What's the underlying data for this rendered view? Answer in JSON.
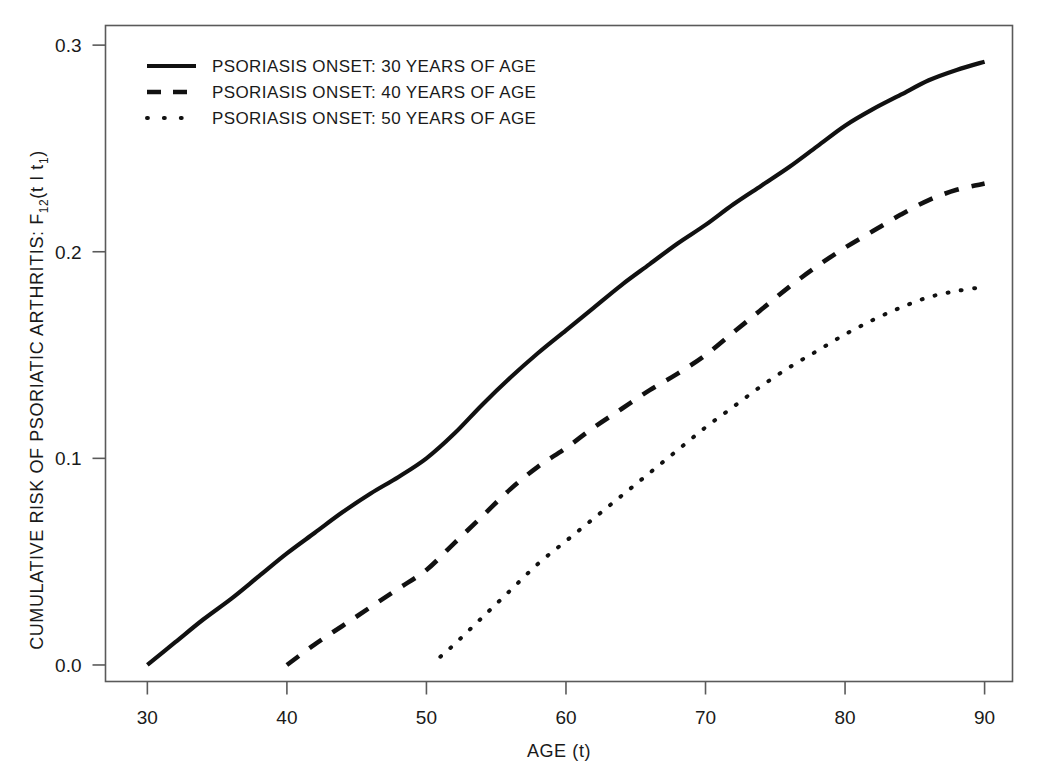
{
  "chart_data": {
    "type": "line",
    "title": "",
    "xlabel": "AGE (t)",
    "ylabel": "CUMULATIVE RISK OF PSORIATIC ARTHRITIS: F12(t | t1)",
    "ylabel_parts": {
      "prefix": "CUMULATIVE RISK OF PSORIATIC ARTHRITIS: F",
      "subscript": "12",
      "suffix": "(t I t",
      "suffix_subscript": "1",
      "tail": ")"
    },
    "xlim": [
      27,
      92
    ],
    "ylim": [
      -0.008,
      0.3095
    ],
    "xticks": [
      30,
      40,
      50,
      60,
      70,
      80,
      90
    ],
    "xticklabels": [
      "30",
      "40",
      "50",
      "60",
      "70",
      "80",
      "90"
    ],
    "yticks": [
      0.0,
      0.1,
      0.2,
      0.3
    ],
    "yticklabels": [
      "0.0",
      "0.1",
      "0.2",
      "0.3"
    ],
    "grid": false,
    "legend_position": "top-left",
    "legend": [
      {
        "label": "PSORIASIS ONSET: 30  YEARS  OF  AGE",
        "style": "solid"
      },
      {
        "label": "PSORIASIS ONSET: 40  YEARS  OF  AGE",
        "style": "dashed"
      },
      {
        "label": "PSORIASIS ONSET: 50  YEARS  OF  AGE",
        "style": "dotted"
      }
    ],
    "series": [
      {
        "name": "PSORIASIS ONSET: 30 YEARS OF AGE",
        "style": "solid",
        "x": [
          30,
          32,
          34,
          36,
          38,
          40,
          42,
          44,
          46,
          48,
          50,
          52,
          54,
          56,
          58,
          60,
          62,
          64,
          66,
          68,
          70,
          72,
          74,
          76,
          78,
          80,
          82,
          84,
          86,
          88,
          90
        ],
        "y": [
          0.0,
          0.011,
          0.022,
          0.032,
          0.043,
          0.054,
          0.064,
          0.074,
          0.083,
          0.091,
          0.1,
          0.112,
          0.126,
          0.139,
          0.151,
          0.162,
          0.173,
          0.184,
          0.194,
          0.204,
          0.213,
          0.223,
          0.232,
          0.241,
          0.251,
          0.261,
          0.269,
          0.276,
          0.283,
          0.288,
          0.292
        ]
      },
      {
        "name": "PSORIASIS ONSET: 40 YEARS OF AGE",
        "style": "dashed",
        "x": [
          40,
          42,
          44,
          46,
          48,
          50,
          52,
          54,
          56,
          58,
          60,
          62,
          64,
          66,
          68,
          70,
          72,
          74,
          76,
          78,
          80,
          82,
          84,
          86,
          88,
          90
        ],
        "y": [
          0.0,
          0.01,
          0.019,
          0.028,
          0.037,
          0.046,
          0.059,
          0.072,
          0.085,
          0.096,
          0.105,
          0.115,
          0.124,
          0.133,
          0.141,
          0.15,
          0.161,
          0.172,
          0.183,
          0.193,
          0.202,
          0.21,
          0.218,
          0.225,
          0.23,
          0.233
        ]
      },
      {
        "name": "PSORIASIS ONSET: 50 YEARS OF AGE",
        "style": "dotted",
        "x": [
          51,
          52,
          54,
          56,
          58,
          60,
          62,
          64,
          66,
          68,
          70,
          72,
          74,
          76,
          78,
          80,
          82,
          84,
          86,
          88,
          90
        ],
        "y": [
          0.004,
          0.01,
          0.023,
          0.036,
          0.049,
          0.06,
          0.071,
          0.082,
          0.093,
          0.104,
          0.115,
          0.125,
          0.135,
          0.144,
          0.152,
          0.16,
          0.167,
          0.173,
          0.178,
          0.181,
          0.183
        ]
      }
    ]
  },
  "colors": {
    "background": "#ffffff",
    "line": "#111111",
    "axis": "#5a5a5a",
    "text": "#1a1a1a"
  }
}
